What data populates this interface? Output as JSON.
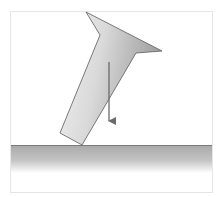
{
  "diagram": {
    "frame": {
      "x": 10,
      "y": 11,
      "width": 202,
      "height": 181,
      "stroke": "#e6e6e6"
    },
    "object": {
      "name": "tilted-nail",
      "fill_light": "#f2f2f2",
      "fill_dark": "#9c9c9c",
      "stroke": "#5a5a5a",
      "points": "86,12 162,51 136,53 82,145 60,133 100,35"
    },
    "weight_arrow": {
      "x": 109,
      "y1": 62,
      "y2": 128,
      "color": "#6b6b6b"
    },
    "floor": {
      "y": 145,
      "x1": 11,
      "x2": 212,
      "line_color": "#7a7a7a",
      "gradient_top": "#a9a9a9",
      "gradient_bottom": "#ffffff",
      "gradient_height": 28
    }
  }
}
